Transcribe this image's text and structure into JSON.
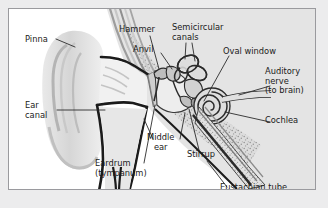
{
  "figure": {
    "panel": {
      "background_color": "#ffffff",
      "border_color": "#9a9a9e",
      "page_background_color": "#ececed"
    },
    "style": {
      "ink_color": "#1b1b1b",
      "leader_line_color": "#2b2b2b",
      "tissue_fill": "#d9d9d9",
      "tissue_fill_light": "#e8e8e8",
      "bone_fill": "#c9c9c9",
      "shadow_fill": "#b0b0b0",
      "dark_fill": "#8a8a8a"
    },
    "labels": [
      {
        "id": "pinna",
        "text": "Pinna",
        "x": 16,
        "y": 28,
        "align": "left"
      },
      {
        "id": "ear-canal",
        "text": "Ear\ncanal",
        "x": 16,
        "y": 94,
        "align": "left"
      },
      {
        "id": "hammer",
        "text": "Hammer",
        "x": 118,
        "y": 18,
        "align": "left"
      },
      {
        "id": "anvil",
        "text": "Anvil",
        "x": 130,
        "y": 38,
        "align": "left"
      },
      {
        "id": "semicircular",
        "text": "Semicircular\ncanals",
        "x": 172,
        "y": 16,
        "align": "left"
      },
      {
        "id": "oval-window",
        "text": "Oval window",
        "x": 222,
        "y": 40,
        "align": "left"
      },
      {
        "id": "auditory-nerve",
        "text": "Auditory\nnerve\n(to brain)",
        "x": 263,
        "y": 60,
        "align": "left"
      },
      {
        "id": "cochlea",
        "text": "Cochlea",
        "x": 263,
        "y": 110,
        "align": "left"
      },
      {
        "id": "middle-ear",
        "text": "Middle\near",
        "x": 145,
        "y": 126,
        "align": "left"
      },
      {
        "id": "stirrup",
        "text": "Stirrup",
        "x": 186,
        "y": 143,
        "align": "left"
      },
      {
        "id": "eardrum",
        "text": "Eardrum\n(tympanum)",
        "x": 92,
        "y": 152,
        "align": "left"
      },
      {
        "id": "eustachian",
        "text": "Eustachian tube",
        "x": 219,
        "y": 176,
        "align": "left"
      }
    ]
  }
}
